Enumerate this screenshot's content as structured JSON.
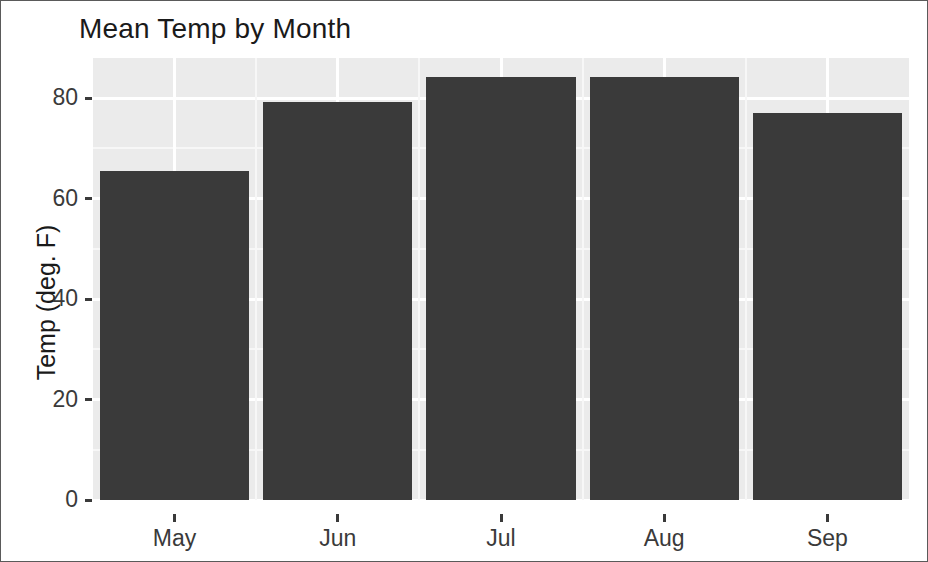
{
  "chart_data": {
    "type": "bar",
    "title": "Mean Temp by Month",
    "xlabel": "",
    "ylabel": "Temp (deg. F)",
    "categories": [
      "May",
      "Jun",
      "Jul",
      "Aug",
      "Sep"
    ],
    "values": [
      65.5,
      79.2,
      84.2,
      84.2,
      77.0
    ],
    "ylim": [
      0,
      88
    ],
    "y_ticks": [
      0,
      20,
      40,
      60,
      80
    ],
    "y_tick_labels": [
      "0",
      "20",
      "40",
      "60",
      "80"
    ],
    "y_minor_ticks": [
      10,
      30,
      50,
      70
    ],
    "grid": true,
    "legend": "none",
    "colors": {
      "bar_fill": "#3a3a3a",
      "panel_background": "#ebebeb",
      "gridline_major": "#ffffff",
      "gridline_minor": "#f7f7f7",
      "text": "#1a1a1a",
      "axis_text": "#3a3a3a",
      "figure_border": "#5a5a5a",
      "figure_background": "#ffffff"
    }
  },
  "axis": {
    "y_title": "Temp (deg. F)",
    "tick_labels_y": [
      "80",
      "60",
      "40",
      "20",
      "0"
    ],
    "tick_labels_x": [
      "May",
      "Jun",
      "Jul",
      "Aug",
      "Sep"
    ]
  },
  "header": {
    "title": "Mean Temp by Month"
  }
}
